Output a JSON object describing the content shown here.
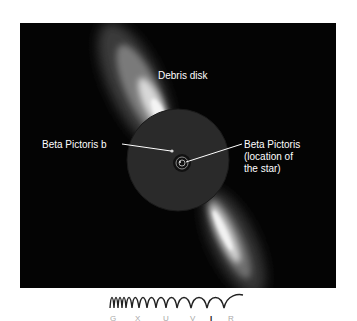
{
  "figure": {
    "labels": {
      "debris_disk": "Debris disk",
      "planet": "Beta Pictoris b",
      "star_line1": "Beta Pictoris",
      "star_line2": "(location of",
      "star_line3": "the star)"
    },
    "colors": {
      "background": "#ffffff",
      "image_background": "#040404",
      "mask_disc": "#2a2a2a",
      "label_text": "#ffffff",
      "band_inactive": "#a8a8a8",
      "band_active": "#222222"
    },
    "wavelength_band": {
      "icon": "wave-spectrum-icon",
      "letters": [
        "G",
        "X",
        "U",
        "V",
        "I",
        "R"
      ],
      "active": "I"
    }
  }
}
